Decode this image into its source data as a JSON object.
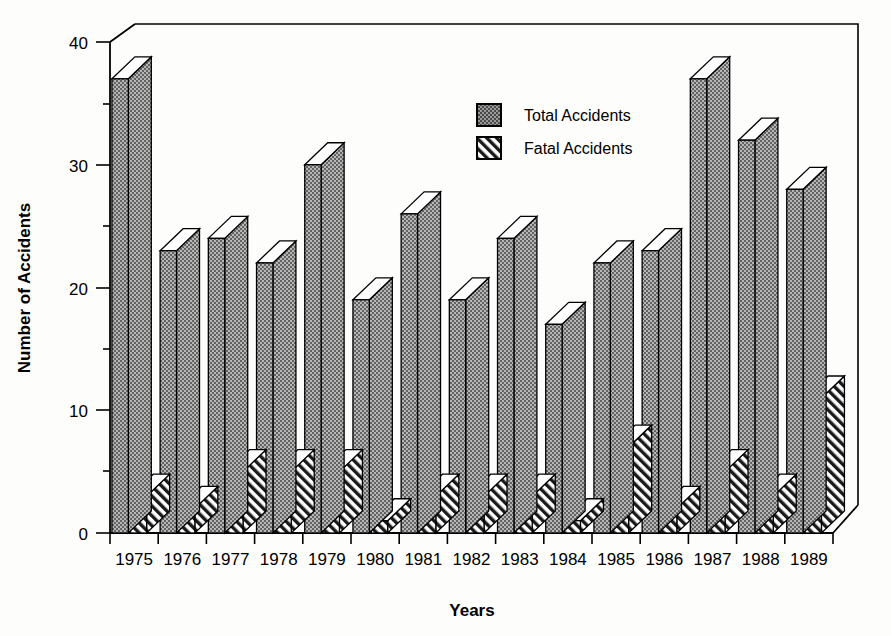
{
  "chart_data": {
    "type": "bar",
    "title": "",
    "xlabel": "Years",
    "ylabel": "Number of Accidents",
    "categories": [
      "1975",
      "1976",
      "1977",
      "1978",
      "1979",
      "1980",
      "1981",
      "1982",
      "1983",
      "1984",
      "1985",
      "1986",
      "1987",
      "1988",
      "1989"
    ],
    "series": [
      {
        "name": "Total Accidents",
        "values": [
          37,
          23,
          24,
          22,
          30,
          19,
          26,
          19,
          24,
          17,
          22,
          23,
          37,
          32,
          28
        ]
      },
      {
        "name": "Fatal Accidents",
        "values": [
          3,
          2,
          5,
          5,
          5,
          1,
          3,
          3,
          3,
          1,
          7,
          2,
          5,
          3,
          11
        ]
      }
    ],
    "ylim": [
      0,
      40
    ],
    "ytick_labels": [
      "0",
      "10",
      "20",
      "30",
      "40"
    ],
    "ytick_values": [
      0,
      10,
      20,
      30,
      40
    ],
    "yminor_values": [
      5,
      15,
      25,
      35
    ],
    "grid": false,
    "legend_position": "upper-center",
    "style": "3d-bar-grayscale",
    "fill_total": "#9b9b9b",
    "fill_fatal": "#ffffff",
    "axis_color": "#000000"
  },
  "legend": {
    "entries": [
      {
        "label": "Total Accidents",
        "swatch": "stipple-swatch"
      },
      {
        "label": "Fatal Accidents",
        "swatch": "hatch-swatch"
      }
    ]
  },
  "axes": {
    "y_title": "Number of Accidents",
    "x_title": "Years"
  }
}
